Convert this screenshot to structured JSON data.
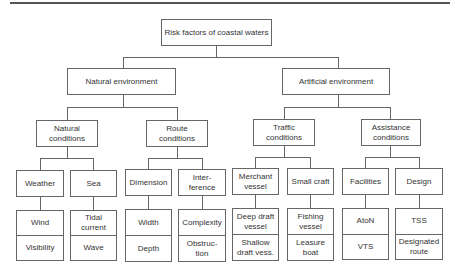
{
  "diagram": {
    "type": "hierarchy-tree",
    "root": "Risk factors of coastal waters",
    "level1": {
      "natural": "Natural environment",
      "artificial": "Artificial environment"
    },
    "level2": {
      "natural_conditions": "Natural\nconditions",
      "route_conditions": "Route\nconditions",
      "traffic_conditions": "Traffic\nconditions",
      "assistance_conditions": "Assistance\nconditions"
    },
    "level3": {
      "weather": "Weather",
      "sea": "Sea",
      "dimension": "Dimension",
      "interference": "Inter-\nference",
      "merchant_vessel": "Merchant\nvessel",
      "small_craft": "Small craft",
      "facilities": "Facilities",
      "design": "Design"
    },
    "level4": {
      "weather": [
        "Wind",
        "Visibility"
      ],
      "sea": [
        "Tidal\ncurrent",
        "Wave"
      ],
      "dimension": [
        "Width",
        "Depth"
      ],
      "interference": [
        "Complexity",
        "Obstruc-\ntion"
      ],
      "merchant_vessel": [
        "Deep draft\nvessel",
        "Shallow\ndraft vess."
      ],
      "small_craft": [
        "Fishing\nvessel",
        "Leasure\nboat"
      ],
      "facilities": [
        "AtoN",
        "VTS"
      ],
      "design": [
        "TSS",
        "Designated\nroute"
      ]
    }
  }
}
